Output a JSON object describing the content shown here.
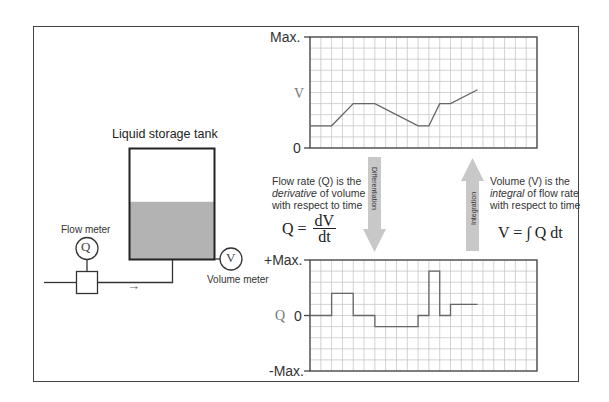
{
  "diagram": {
    "title": "Liquid storage tank",
    "flow_meter_label": "Flow meter",
    "flow_meter_symbol": "Q",
    "volume_meter_label": "Volume meter",
    "volume_meter_symbol": "V",
    "flow_direction_glyph": "→",
    "liquid_level_fraction": 0.52,
    "colors": {
      "liquid": "#b3b3b3",
      "line": "#333333",
      "grid": "#c8c8c8",
      "arrow": "#c8c8c8",
      "trace": "#666666"
    }
  },
  "differentiation": {
    "arrow_label": "Differentiation",
    "text_line1": "Flow rate (Q) is the",
    "text_line2_em": "derivative",
    "text_line2_rest": " of volume",
    "text_line3": "with respect to time",
    "formula_lhs": "Q =",
    "formula_num": "dV",
    "formula_den": "dt"
  },
  "integration": {
    "arrow_label": "Integration",
    "text_line1": "Volume (V) is the",
    "text_line2_em": "integral",
    "text_line2_rest": " of flow rate",
    "text_line3": "with respect to time",
    "formula": "V = ∫ Q dt"
  },
  "chart_data": [
    {
      "type": "line",
      "title": "Volume vs time",
      "ylabel": "V",
      "y_tick_labels": {
        "top": "Max.",
        "bottom": "0"
      },
      "grid": true,
      "x_units": "grid divisions",
      "y_units": "grid divisions",
      "xlim": [
        0,
        21
      ],
      "ylim": [
        0,
        10
      ],
      "x": [
        0,
        2,
        4,
        6,
        10,
        11,
        12,
        13,
        15.5
      ],
      "y": [
        2,
        2,
        4,
        4,
        2,
        2,
        4,
        4,
        5.25
      ]
    },
    {
      "type": "line",
      "title": "Flow rate vs time",
      "ylabel": "Q",
      "y_tick_labels": {
        "top": "+Max.",
        "zero": "0",
        "bottom": "-Max."
      },
      "grid": true,
      "x_units": "grid divisions",
      "y_units": "grid divisions",
      "xlim": [
        0,
        21
      ],
      "ylim": [
        -5,
        5
      ],
      "steps": [
        {
          "x0": 0,
          "x1": 2,
          "y": 0
        },
        {
          "x0": 2,
          "x1": 4,
          "y": 2
        },
        {
          "x0": 4,
          "x1": 6,
          "y": 0
        },
        {
          "x0": 6,
          "x1": 10,
          "y": -1
        },
        {
          "x0": 10,
          "x1": 11,
          "y": 0
        },
        {
          "x0": 11,
          "x1": 12,
          "y": 4
        },
        {
          "x0": 12,
          "x1": 13,
          "y": 0
        },
        {
          "x0": 13,
          "x1": 15.5,
          "y": 1
        }
      ]
    }
  ]
}
